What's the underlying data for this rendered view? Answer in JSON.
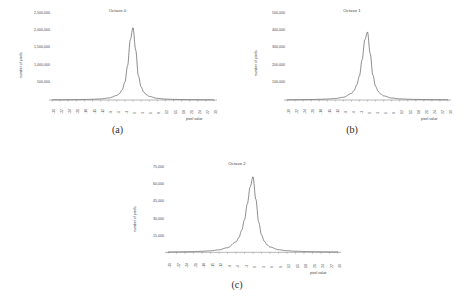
{
  "figure": {
    "panels": [
      {
        "caption": "(a)",
        "chart_data": {
          "type": "line",
          "title": "Octave 0",
          "xlabel": "pixel value",
          "ylabel": "number of pixels",
          "grid": false,
          "legend": "none",
          "xlim": [
            -30,
            30
          ],
          "ylim": [
            0,
            2500000
          ],
          "xticks": [
            "-30",
            "-27",
            "-24",
            "-21",
            "-18",
            "-15",
            "-12",
            "-9",
            "-6",
            "-3",
            "0",
            "3",
            "6",
            "9",
            "12",
            "15",
            "18",
            "21",
            "24",
            "27",
            "30"
          ],
          "yticks": [
            "2,500,000",
            "2,000,000",
            "1,500,000",
            "1,000,000",
            "500,000"
          ],
          "ytick_values": [
            2500000,
            2000000,
            1500000,
            1000000,
            500000
          ],
          "x": [
            -30,
            -27,
            -24,
            -21,
            -18,
            -15,
            -12,
            -9,
            -6,
            -5,
            -4,
            -3,
            -2,
            -1,
            0,
            1,
            2,
            3,
            4,
            5,
            6,
            9,
            12,
            15,
            18,
            21,
            24,
            27,
            30
          ],
          "values": [
            6000,
            7000,
            8500,
            11000,
            15000,
            21000,
            32000,
            58000,
            130000,
            190000,
            300000,
            520000,
            1000000,
            1750000,
            2100000,
            1450000,
            700000,
            380000,
            230000,
            150000,
            105000,
            48000,
            27000,
            18000,
            13000,
            10000,
            8000,
            6500,
            5500
          ],
          "peak_x": 0,
          "peak_y": 2100000
        }
      },
      {
        "caption": "(b)",
        "chart_data": {
          "type": "line",
          "title": "Octave 1",
          "xlabel": "pixel value",
          "ylabel": "number of pixels",
          "grid": false,
          "legend": "none",
          "xlim": [
            -30,
            30
          ],
          "ylim": [
            0,
            500000
          ],
          "xticks": [
            "-30",
            "-27",
            "-24",
            "-21",
            "-18",
            "-15",
            "-12",
            "-9",
            "-6",
            "-3",
            "0",
            "3",
            "6",
            "9",
            "12",
            "15",
            "18",
            "21",
            "24",
            "27",
            "30"
          ],
          "yticks": [
            "500,000",
            "400,000",
            "300,000",
            "200,000",
            "100,000"
          ],
          "ytick_values": [
            500000,
            400000,
            300000,
            200000,
            100000
          ],
          "x": [
            -30,
            -27,
            -24,
            -21,
            -18,
            -15,
            -12,
            -9,
            -6,
            -5,
            -4,
            -3,
            -2,
            -1,
            0,
            1,
            2,
            3,
            4,
            5,
            6,
            9,
            12,
            15,
            18,
            21,
            24,
            27,
            30
          ],
          "values": [
            1400,
            1700,
            2100,
            2800,
            3900,
            5600,
            8800,
            16000,
            38000,
            55000,
            88000,
            140000,
            235000,
            350000,
            395000,
            270000,
            145000,
            80000,
            50000,
            34000,
            24000,
            11500,
            6800,
            4600,
            3400,
            2600,
            2100,
            1750,
            1500
          ],
          "peak_x": 0,
          "peak_y": 395000
        }
      },
      {
        "caption": "(c)",
        "chart_data": {
          "type": "line",
          "title": "Octave 2",
          "xlabel": "pixel value",
          "ylabel": "number of pixels",
          "grid": false,
          "legend": "none",
          "xlim": [
            -30,
            30
          ],
          "ylim": [
            0,
            75000
          ],
          "xticks": [
            "-30",
            "-27",
            "-24",
            "-21",
            "-18",
            "-15",
            "-12",
            "-9",
            "-6",
            "-3",
            "0",
            "3",
            "6",
            "9",
            "12",
            "15",
            "18",
            "21",
            "24",
            "27",
            "30"
          ],
          "yticks": [
            "75,000",
            "60,000",
            "45,000",
            "30,000",
            "15,000"
          ],
          "ytick_values": [
            75000,
            60000,
            45000,
            30000,
            15000
          ],
          "x": [
            -30,
            -27,
            -24,
            -21,
            -18,
            -15,
            -12,
            -9,
            -6,
            -5,
            -4,
            -3,
            -2,
            -1,
            0,
            1,
            2,
            3,
            4,
            5,
            6,
            9,
            12,
            15,
            18,
            21,
            24,
            27,
            30
          ],
          "values": [
            300,
            380,
            480,
            640,
            900,
            1350,
            2200,
            4100,
            9200,
            13000,
            19500,
            29000,
            43000,
            58000,
            67000,
            47000,
            27000,
            15500,
            9800,
            6600,
            4700,
            2300,
            1400,
            960,
            700,
            540,
            430,
            360,
            310
          ],
          "peak_x": 0,
          "peak_y": 67000
        }
      }
    ]
  }
}
